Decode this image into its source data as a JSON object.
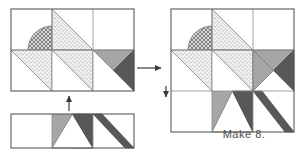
{
  "document": {
    "type": "quilt-block-assembly-diagram",
    "title": "Quilt block assembly diagram",
    "caption": "Make 8."
  },
  "colors": {
    "outline": "#595959",
    "grid_line": "#8c8c8c",
    "background": "#ffffff",
    "white_fabric": "#ffffff",
    "light_gray_fabric": "#a8a8a8",
    "medium_gray_fabric": "#9a9a9a",
    "dark_gray_fabric": "#5f5f5f",
    "stipple_fabric": "#e8e8e8",
    "net_fabric": "#c9c9c9",
    "arrow": "#3a3a3a",
    "caption_text": "#4c4c4c"
  },
  "fabrics": [
    {
      "id": "white",
      "name": "white-solid",
      "fill": "#ffffff"
    },
    {
      "id": "stipple",
      "name": "light-stipple-print",
      "fill": "#ececec"
    },
    {
      "id": "net",
      "name": "dark-net-print",
      "fill": "#c2c2c2"
    },
    {
      "id": "lightgray",
      "name": "light-gray-solid",
      "fill": "#a6a6a6"
    },
    {
      "id": "darkgray",
      "name": "dark-gray-solid",
      "fill": "#585858"
    }
  ],
  "units": {
    "cell_size": 41,
    "grid_columns": 3,
    "grid_rows": 3
  },
  "partial_block": {
    "label": "partial-block-two-rows",
    "x": 11,
    "y": 9,
    "columns": 3,
    "rows": 2,
    "description": "Top two rows of the star block: flower-petal arc unit, stippled star points, and gray/dark half-square triangles."
  },
  "bottom_strip": {
    "label": "bottom-row-strip",
    "x": 11,
    "y": 114,
    "columns": 3,
    "rows": 1,
    "cells": [
      {
        "index": 0,
        "content": "plain-white-square"
      },
      {
        "index": 1,
        "content": "light-gray-square-with-dark-triangle"
      },
      {
        "index": 2,
        "content": "white-square-with-dark-diagonal-band"
      }
    ]
  },
  "assembled_block": {
    "label": "completed-star-block",
    "x": 171,
    "y": 9,
    "columns": 3,
    "rows": 3,
    "description": "Finished 3x3 star block with pinwheel center of light and dark gray points."
  },
  "arrows": [
    {
      "name": "arrow-right-to-result",
      "direction": "right",
      "x1": 136,
      "y1": 68,
      "x2": 163,
      "y2": 68
    },
    {
      "name": "arrow-up-join-strip",
      "direction": "up",
      "x1": 69,
      "y1": 110,
      "x2": 69,
      "y2": 95
    },
    {
      "name": "arrow-down-seam-marker",
      "direction": "down",
      "x1": 166,
      "y1": 86,
      "x2": 166,
      "y2": 98
    }
  ]
}
